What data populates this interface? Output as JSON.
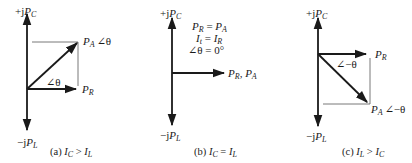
{
  "colors": {
    "ink": "#1a1a1a",
    "thin": "#555555",
    "background": "#ffffff"
  },
  "panels": [
    {
      "id": "a",
      "axis_top_label": {
        "prefix": "+j",
        "P": "P",
        "sub": "C"
      },
      "axis_bottom_label": {
        "prefix": "−j",
        "P": "P",
        "sub": "L"
      },
      "pa_label": {
        "P": "P",
        "sub": "A",
        "angle": "∠θ"
      },
      "pr_label": {
        "P": "P",
        "sub": "R"
      },
      "angle_label": "∠θ",
      "caption": {
        "prefix": "(a) ",
        "I1": "I",
        "s1": "C",
        "op": " > ",
        "I2": "I",
        "s2": "L"
      }
    },
    {
      "id": "b",
      "axis_top_label": {
        "prefix": "+j",
        "P": "P",
        "sub": "C"
      },
      "axis_bottom_label": {
        "prefix": "−j",
        "P": "P",
        "sub": "L"
      },
      "notes": [
        {
          "l": "P",
          "ls": "R",
          "op": " = ",
          "r": "P",
          "rs": "A"
        },
        {
          "l": "I",
          "ls": "t",
          "op": " = ",
          "r": "I",
          "rs": "R"
        },
        {
          "text": "∠θ = 0°"
        }
      ],
      "horizontal_label": {
        "P1": "P",
        "s1": "R",
        "sep": ", ",
        "P2": "P",
        "s2": "A"
      },
      "caption": {
        "prefix": "(b) ",
        "I1": "I",
        "s1": "C",
        "op": " = ",
        "I2": "I",
        "s2": "L"
      }
    },
    {
      "id": "c",
      "axis_top_label": {
        "prefix": "+j",
        "P": "P",
        "sub": "C"
      },
      "axis_bottom_label": {
        "prefix": "−j",
        "P": "P",
        "sub": "L"
      },
      "pr_label": {
        "P": "P",
        "sub": "R"
      },
      "angle_label": "∠−θ",
      "pa_label": {
        "P": "P",
        "sub": "A",
        "angle": "∠−θ"
      },
      "caption": {
        "prefix": "(c) ",
        "I1": "I",
        "s1": "L",
        "op": " > ",
        "I2": "I",
        "s2": "C"
      }
    }
  ]
}
